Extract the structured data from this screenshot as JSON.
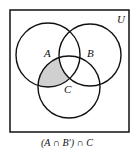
{
  "diagram": {
    "type": "venn",
    "universe_label": "U",
    "sets": [
      {
        "label": "A",
        "cx": 48,
        "cy": 55,
        "r": 32
      },
      {
        "label": "B",
        "cx": 90,
        "cy": 55,
        "r": 31
      },
      {
        "label": "C",
        "cx": 69,
        "cy": 87,
        "r": 31
      }
    ],
    "shaded_region": "(A ∩ B') ∩ C",
    "shade_color": "#d0d0d0",
    "caption": "(A ∩ B′) ∩ C"
  }
}
